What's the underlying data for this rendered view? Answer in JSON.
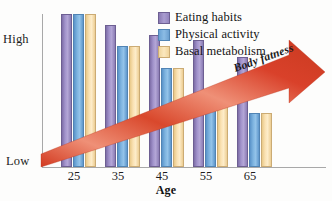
{
  "chart_data": {
    "type": "bar",
    "title": "",
    "xlabel": "Age",
    "ylabel": "",
    "categories": [
      "25",
      "35",
      "45",
      "55",
      "65"
    ],
    "ytick_labels": [
      "High",
      "Low"
    ],
    "ylim_labels": {
      "top": "High",
      "bottom": "Low"
    },
    "grid": false,
    "legend_position": "top-right",
    "series": [
      {
        "name": "Eating habits",
        "color": "#a294cc",
        "values": [
          100,
          93,
          86,
          83,
          72
        ]
      },
      {
        "name": "Physical activity",
        "color": "#7eb4e0",
        "values": [
          100,
          79,
          65,
          50,
          35
        ]
      },
      {
        "name": "Basal metabolism",
        "color": "#fae2b4",
        "values": [
          100,
          79,
          65,
          50,
          35
        ]
      }
    ],
    "annotations": [
      {
        "text": "Body fatness",
        "type": "arrow",
        "color": "#d9412a",
        "direction": "up-right",
        "from": "low-left",
        "to": "high-right"
      }
    ]
  },
  "legend": {
    "items": [
      {
        "label": "Eating habits",
        "swatch": "eating"
      },
      {
        "label": "Physical activity",
        "swatch": "physical"
      },
      {
        "label": "Basal metabolism",
        "swatch": "basal"
      }
    ]
  },
  "axes": {
    "y_high_label": "High",
    "y_low_label": "Low",
    "x_title": "Age",
    "x_ticks": [
      "25",
      "35",
      "45",
      "55",
      "65"
    ]
  },
  "arrow": {
    "label": "Body fatness"
  },
  "colors": {
    "eating_habits": "#a294cc",
    "physical_activity": "#7eb4e0",
    "basal_metabolism": "#fae2b4",
    "arrow_red": "#d9412a",
    "arrow_red_light": "#ef8f78",
    "axis_gray": "#a8a8a8"
  }
}
